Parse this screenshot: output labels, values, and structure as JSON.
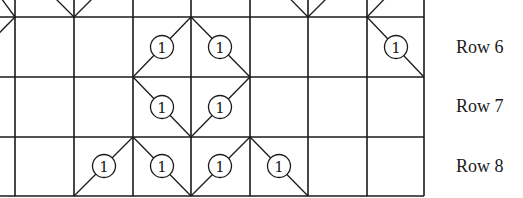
{
  "diagram": {
    "type": "chart-grid",
    "stroke_color": "#1a1a1a",
    "background": "#ffffff",
    "grid": {
      "x_lines": [
        15,
        74,
        133,
        191,
        250,
        308,
        367,
        424
      ],
      "y_lines": [
        17,
        77,
        137,
        196
      ],
      "x_range": [
        0,
        424
      ],
      "y_range": [
        0,
        196
      ]
    },
    "node_label": "1",
    "diagonals": [
      {
        "row": 5,
        "from": [
          -10,
          -17
        ],
        "to": [
          15,
          17
        ]
      },
      {
        "row": 5,
        "from": [
          15,
          -42
        ],
        "to": [
          74,
          17
        ]
      },
      {
        "row": 5,
        "from": [
          133,
          -42
        ],
        "to": [
          74,
          17
        ]
      },
      {
        "row": 5,
        "from": [
          250,
          -42
        ],
        "to": [
          308,
          17
        ]
      },
      {
        "row": 5,
        "from": [
          367,
          -42
        ],
        "to": [
          308,
          17
        ]
      },
      {
        "row": 5,
        "from": [
          424,
          -42
        ],
        "to": [
          367,
          17
        ]
      },
      {
        "row": 6,
        "from": [
          15,
          17
        ],
        "to": [
          -44,
          77
        ]
      },
      {
        "row": 6,
        "from": [
          133,
          77
        ],
        "to": [
          191,
          17
        ]
      },
      {
        "row": 6,
        "from": [
          191,
          17
        ],
        "to": [
          250,
          77
        ]
      },
      {
        "row": 6,
        "from": [
          367,
          17
        ],
        "to": [
          424,
          77
        ]
      },
      {
        "row": 7,
        "from": [
          133,
          77
        ],
        "to": [
          191,
          137
        ]
      },
      {
        "row": 7,
        "from": [
          250,
          77
        ],
        "to": [
          191,
          137
        ]
      },
      {
        "row": 8,
        "from": [
          74,
          196
        ],
        "to": [
          133,
          137
        ]
      },
      {
        "row": 8,
        "from": [
          133,
          137
        ],
        "to": [
          191,
          196
        ]
      },
      {
        "row": 8,
        "from": [
          250,
          137
        ],
        "to": [
          191,
          196
        ]
      },
      {
        "row": 8,
        "from": [
          250,
          137
        ],
        "to": [
          308,
          196
        ]
      }
    ],
    "nodes": [
      {
        "row": 5,
        "x": 45,
        "y": -13
      },
      {
        "row": 5,
        "x": 103,
        "y": -13
      },
      {
        "row": 5,
        "x": 279,
        "y": -13
      },
      {
        "row": 5,
        "x": 337,
        "y": -13
      },
      {
        "row": 5,
        "x": 395,
        "y": -13
      },
      {
        "row": 6,
        "x": 162,
        "y": 47
      },
      {
        "row": 6,
        "x": 220,
        "y": 47
      },
      {
        "row": 6,
        "x": 396,
        "y": 47
      },
      {
        "row": 7,
        "x": 162,
        "y": 107
      },
      {
        "row": 7,
        "x": 220,
        "y": 107
      },
      {
        "row": 8,
        "x": 104,
        "y": 166
      },
      {
        "row": 8,
        "x": 162,
        "y": 166
      },
      {
        "row": 8,
        "x": 220,
        "y": 166
      },
      {
        "row": 8,
        "x": 279,
        "y": 166
      }
    ]
  },
  "row_labels": [
    {
      "label": "Row 6",
      "y": 38
    },
    {
      "label": "Row 7",
      "y": 97
    },
    {
      "label": "Row 8",
      "y": 157
    }
  ]
}
